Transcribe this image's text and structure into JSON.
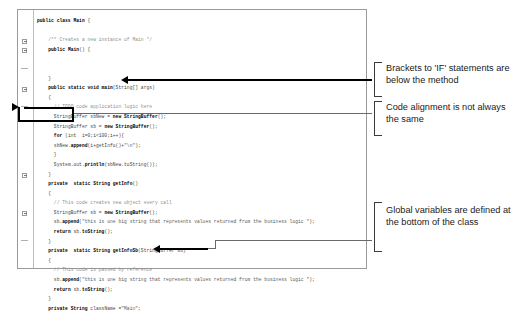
{
  "code_panel": {
    "lines": [
      {
        "indent": 0,
        "segments": [
          {
            "t": "public class ",
            "c": "kw"
          },
          {
            "t": "Main",
            "c": "kw"
          },
          {
            "t": " {",
            "c": "pln"
          }
        ]
      },
      {
        "indent": 0,
        "segments": []
      },
      {
        "indent": 2,
        "segments": [
          {
            "t": "/** Creates a new instance of Main */",
            "c": "cmt"
          }
        ]
      },
      {
        "indent": 2,
        "segments": [
          {
            "t": "public ",
            "c": "kw"
          },
          {
            "t": "Main",
            "c": "kw"
          },
          {
            "t": "() {",
            "c": "pln"
          }
        ]
      },
      {
        "indent": 0,
        "segments": []
      },
      {
        "indent": 0,
        "segments": []
      },
      {
        "indent": 2,
        "segments": [
          {
            "t": "}",
            "c": "pln"
          }
        ]
      },
      {
        "indent": 2,
        "segments": [
          {
            "t": "public static void ",
            "c": "kw"
          },
          {
            "t": "main",
            "c": "kw"
          },
          {
            "t": "(String[] args)",
            "c": "pln"
          }
        ]
      },
      {
        "indent": 2,
        "segments": [
          {
            "t": "{",
            "c": "pln"
          }
        ]
      },
      {
        "indent": 3,
        "segments": [
          {
            "t": "// TODO code application logic here",
            "c": "cmt"
          }
        ]
      },
      {
        "indent": 3,
        "segments": [
          {
            "t": "StringBuffer sbNew = ",
            "c": "pln"
          },
          {
            "t": "new StringBuffer",
            "c": "kw"
          },
          {
            "t": "();",
            "c": "pln"
          }
        ]
      },
      {
        "indent": 3,
        "segments": [
          {
            "t": "StringBuffer sb = ",
            "c": "pln"
          },
          {
            "t": "new StringBuffer",
            "c": "kw"
          },
          {
            "t": "();",
            "c": "pln"
          }
        ]
      },
      {
        "indent": 3,
        "segments": [
          {
            "t": "for ",
            "c": "kw"
          },
          {
            "t": "(int  i=0;i<100;i++){",
            "c": "pln"
          }
        ]
      },
      {
        "indent": 3,
        "segments": [
          {
            "t": "sbNew.",
            "c": "pln"
          },
          {
            "t": "append",
            "c": "kw"
          },
          {
            "t": "(i+getInfo()+",
            "c": "pln"
          },
          {
            "t": "\"\\n\"",
            "c": "str"
          },
          {
            "t": ");",
            "c": "pln"
          }
        ]
      },
      {
        "indent": 3,
        "segments": [
          {
            "t": "}",
            "c": "pln"
          }
        ]
      },
      {
        "indent": 3,
        "segments": [
          {
            "t": "System.out.",
            "c": "pln"
          },
          {
            "t": "println",
            "c": "kw"
          },
          {
            "t": "(sbNew.toString());",
            "c": "pln"
          }
        ]
      },
      {
        "indent": 2,
        "segments": [
          {
            "t": "}",
            "c": "pln"
          }
        ]
      },
      {
        "indent": 2,
        "segments": [
          {
            "t": "private  static String ",
            "c": "kw"
          },
          {
            "t": "getInfo",
            "c": "kw"
          },
          {
            "t": "()",
            "c": "pln"
          }
        ]
      },
      {
        "indent": 2,
        "segments": [
          {
            "t": "{",
            "c": "pln"
          }
        ]
      },
      {
        "indent": 3,
        "segments": [
          {
            "t": "// This code creates new object every call",
            "c": "cmt"
          }
        ]
      },
      {
        "indent": 3,
        "segments": [
          {
            "t": "StringBuffer sb = ",
            "c": "pln"
          },
          {
            "t": "new StringBuffer",
            "c": "kw"
          },
          {
            "t": "();",
            "c": "pln"
          }
        ]
      },
      {
        "indent": 3,
        "segments": [
          {
            "t": "sb.",
            "c": "pln"
          },
          {
            "t": "append",
            "c": "kw"
          },
          {
            "t": "(",
            "c": "pln"
          },
          {
            "t": "\"this is one big string that represents values returned from the business logic \"",
            "c": "str"
          },
          {
            "t": ");",
            "c": "pln"
          }
        ]
      },
      {
        "indent": 3,
        "segments": [
          {
            "t": "return ",
            "c": "kw"
          },
          {
            "t": "sb.",
            "c": "pln"
          },
          {
            "t": "toString",
            "c": "kw"
          },
          {
            "t": "();",
            "c": "pln"
          }
        ]
      },
      {
        "indent": 2,
        "segments": [
          {
            "t": "}",
            "c": "pln"
          }
        ]
      },
      {
        "indent": 2,
        "segments": [
          {
            "t": "private  static String ",
            "c": "kw"
          },
          {
            "t": "getInfoSb",
            "c": "kw"
          },
          {
            "t": "(StringBuffer sb)",
            "c": "pln"
          }
        ]
      },
      {
        "indent": 2,
        "segments": [
          {
            "t": "{",
            "c": "pln"
          }
        ]
      },
      {
        "indent": 3,
        "segments": [
          {
            "t": "// This code is passed by reference",
            "c": "cmt"
          }
        ]
      },
      {
        "indent": 3,
        "segments": [
          {
            "t": "sb.",
            "c": "pln"
          },
          {
            "t": "append",
            "c": "kw"
          },
          {
            "t": "(",
            "c": "pln"
          },
          {
            "t": "\"this is one big string that represents values returned from the business logic \"",
            "c": "str"
          },
          {
            "t": ");",
            "c": "pln"
          }
        ]
      },
      {
        "indent": 3,
        "segments": [
          {
            "t": "return ",
            "c": "kw"
          },
          {
            "t": "sb.",
            "c": "pln"
          },
          {
            "t": "toString",
            "c": "kw"
          },
          {
            "t": "();",
            "c": "pln"
          }
        ]
      },
      {
        "indent": 2,
        "segments": [
          {
            "t": "}",
            "c": "pln"
          }
        ]
      },
      {
        "indent": 2,
        "segments": [
          {
            "t": "private String ",
            "c": "kw"
          },
          {
            "t": "className =",
            "c": "pln"
          },
          {
            "t": "\"Main\"",
            "c": "str"
          },
          {
            "t": ";",
            "c": "pln"
          }
        ]
      }
    ]
  },
  "callouts": [
    {
      "id": "callout-brackets",
      "text": "Brackets to 'IF' statements are below the method"
    },
    {
      "id": "callout-alignment",
      "text": "Code alignment is not always the same"
    },
    {
      "id": "callout-globals",
      "text": "Global variables are defined at the bottom of the class"
    }
  ],
  "colors": {
    "panel_border": "#9a9a9a",
    "annotation_text": "#1a1a1a",
    "leader_line": "#6a6a6a",
    "arrow": "#000000"
  }
}
